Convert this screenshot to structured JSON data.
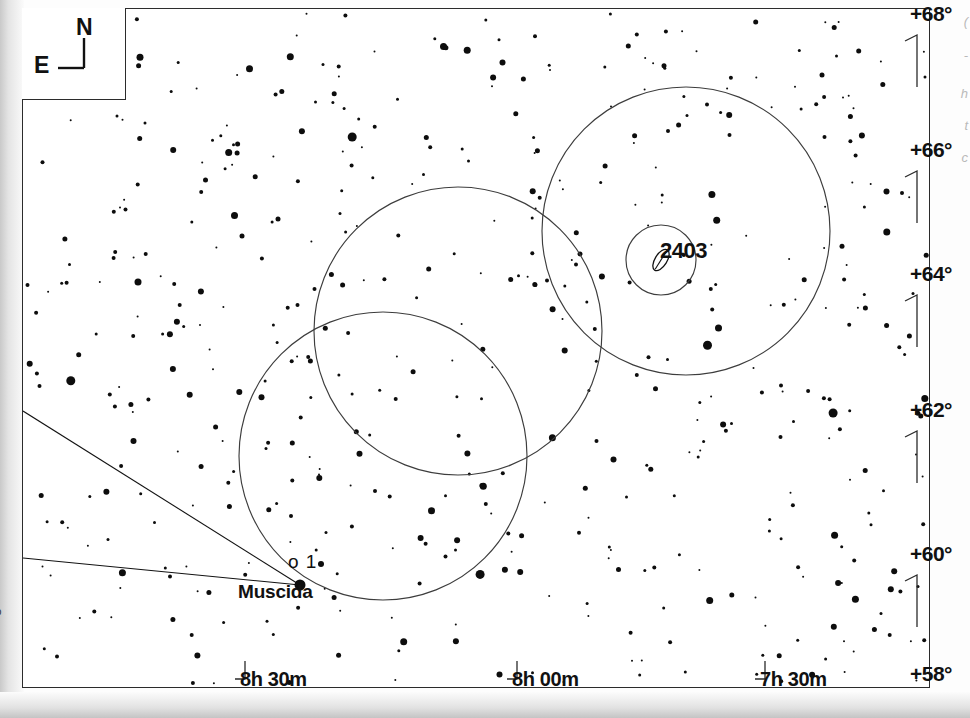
{
  "chart_data": {
    "type": "scatter",
    "xlabel": "Right Ascension",
    "ylabel": "Declination",
    "grid": false,
    "legend": "none",
    "projection": "equatorial",
    "x_axis": {
      "name": "Right Ascension",
      "tick_labels": [
        "8h 30m",
        "8h 00m",
        "7h 30m"
      ],
      "tick_x_px": [
        236,
        508,
        756
      ],
      "range": [
        "8h 45m",
        "7h 15m"
      ],
      "direction": "right-to-left-increasing"
    },
    "y_axis": {
      "name": "Declination",
      "tick_labels": [
        "+68°",
        "+66°",
        "+64°",
        "+62°",
        "+60°",
        "+58°"
      ],
      "tick_y_px": [
        16,
        152,
        276,
        412,
        556,
        676
      ],
      "range": [
        "+57°",
        "+69°"
      ]
    },
    "compass": {
      "north": "N",
      "east": "E"
    },
    "deep_sky_objects": [
      {
        "label": "2403",
        "type": "galaxy",
        "x": 638,
        "y": 251,
        "marker": "ellipse",
        "note": "NGC 2403 spiral galaxy"
      }
    ],
    "named_stars": [
      {
        "label": "Muscida",
        "greek": "ο 1",
        "x": 277,
        "y": 576,
        "magnitude": 3.4,
        "size_px": 11
      }
    ],
    "fov_circles": [
      {
        "name": "eyepiece-field-1",
        "cx": 663,
        "cy": 222,
        "r": 144
      },
      {
        "name": "eyepiece-field-2",
        "cx": 435,
        "cy": 322,
        "r": 144
      },
      {
        "name": "eyepiece-field-3",
        "cx": 360,
        "cy": 447,
        "r": 144
      },
      {
        "name": "object-marker-circle",
        "cx": 638,
        "cy": 251,
        "r": 35
      }
    ],
    "constellation_lines": [
      {
        "from_px": [
          0,
          402
        ],
        "to_px": [
          277,
          576
        ]
      },
      {
        "from_px": [
          0,
          549
        ],
        "to_px": [
          277,
          576
        ]
      }
    ],
    "star_count": 520,
    "magnitude_sizes": [
      2,
      3,
      4,
      5,
      6,
      7,
      9,
      11
    ]
  },
  "compass": {
    "north_label": "N",
    "east_label": "E"
  },
  "dec_labels": [
    {
      "text": "+68°",
      "top": 2,
      "right": 18
    },
    {
      "text": "+66°",
      "top": 138,
      "right": 18
    },
    {
      "text": "+64°",
      "top": 262,
      "right": 18
    },
    {
      "text": "+62°",
      "top": 398,
      "right": 18
    },
    {
      "text": "+60°",
      "top": 542,
      "right": 18
    },
    {
      "text": "+58°",
      "top": 662,
      "right": 18
    }
  ],
  "ra_labels": [
    {
      "text": "8h 30m",
      "left": 240,
      "top": 668
    },
    {
      "text": "8h 00m",
      "left": 512,
      "top": 668
    },
    {
      "text": "7h 30m",
      "left": 760,
      "top": 668
    }
  ],
  "object_labels": [
    {
      "text": "2403",
      "left": 660,
      "top": 238
    }
  ],
  "star_labels": [
    {
      "text": "ο 1",
      "left": 288,
      "top": 551,
      "style": "greek"
    },
    {
      "text": "Muscida",
      "left": 238,
      "top": 581,
      "style": "name"
    }
  ],
  "credit": {
    "text": "Megastar"
  },
  "edge_notes": [
    {
      "text": "(",
      "top": 14
    },
    {
      "text": "-",
      "top": 48
    },
    {
      "text": "h",
      "top": 86
    },
    {
      "text": "t",
      "top": 118
    },
    {
      "text": "c",
      "top": 150
    }
  ],
  "colors": {
    "ink": "#111111",
    "frame": "#2b2b2b",
    "star": "#0d0d0d",
    "circle": "#3d3d3d",
    "paper": "#ffffff",
    "credit": "#3a3a3a"
  }
}
